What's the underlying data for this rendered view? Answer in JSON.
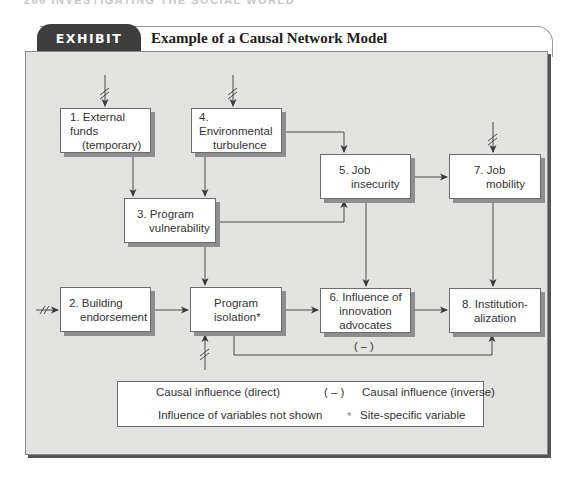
{
  "running_head": "266   INVESTIGATING THE SOCIAL WORLD",
  "exhibit": {
    "tab_label": "EXHIBIT 10.4",
    "title": "Example of a Causal Network Model"
  },
  "nodes": {
    "n1": {
      "line1": "1. External funds",
      "line2": "(temporary)"
    },
    "n4": {
      "line1": "4. Environmental",
      "line2": "turbulence"
    },
    "n5": {
      "line1": "5. Job",
      "line2": "insecurity"
    },
    "n7": {
      "line1": "7. Job",
      "line2": "mobility"
    },
    "n3": {
      "line1": "3. Program",
      "line2": "vulnerability"
    },
    "n2": {
      "line1": "2. Building",
      "line2": "endorsement"
    },
    "niso": {
      "line1": "Program",
      "line2": "isolation*"
    },
    "n6": {
      "line1": "6. Influence of",
      "line2": "innovation",
      "line3": "advocates"
    },
    "n8": {
      "line1": "8. Institution-",
      "line2": "alization"
    }
  },
  "inverse_edge_label": "( – )",
  "legend": {
    "direct": "Causal influence (direct)",
    "inverse_marker": "( – )",
    "inverse": "Causal influence (inverse)",
    "not_shown": "Influence of variables not shown",
    "site_marker": "*",
    "site_specific": "Site-specific variable"
  },
  "colors": {
    "panel_bg": "#e3e3e1",
    "tab_bg": "#3e3e3e",
    "line": "#4a4a4a"
  }
}
